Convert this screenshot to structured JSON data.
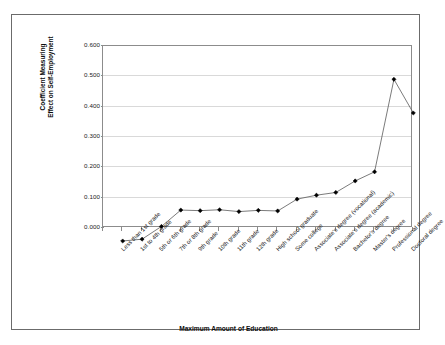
{
  "chart_data": {
    "type": "line",
    "title": "",
    "xlabel": "Maximum Amount of Education",
    "ylabel_line1": "Coefficient Measuring",
    "ylabel_line2": "Effect on Self-Employment",
    "categories": [
      "Less than 1st grade",
      "1st to 4th grade",
      "5th or 6th grade",
      "7th or 8th grade",
      "9th grade",
      "10th grade",
      "11th grade",
      "12th grade",
      "High school graduate",
      "Some college",
      "Associate's degree (vocational)",
      "Associate's degree (academic)",
      "Bachelor's degree",
      "Master's degree",
      "Professional degree",
      "Doctoral degree"
    ],
    "values": [
      0.0,
      0.006,
      0.048,
      0.102,
      0.1,
      0.103,
      0.097,
      0.101,
      0.099,
      0.138,
      0.151,
      0.16,
      0.198,
      0.228,
      0.533,
      0.422
    ],
    "ylim": [
      0.0,
      0.6
    ],
    "ytick_labels": [
      "0.000",
      "0.100",
      "0.200",
      "0.300",
      "0.400",
      "0.500",
      "0.600"
    ],
    "ytick_values": [
      0.0,
      0.1,
      0.2,
      0.3,
      0.4,
      0.5,
      0.6
    ],
    "grid": true,
    "legend": "none",
    "series_color": "#000000",
    "line_color": "#595959",
    "marker": "diamond",
    "gridline_color": "#d9d9d9",
    "axis_color": "#8c8c8c",
    "frame_color": "#6b6b6b",
    "background": "#ffffff"
  }
}
